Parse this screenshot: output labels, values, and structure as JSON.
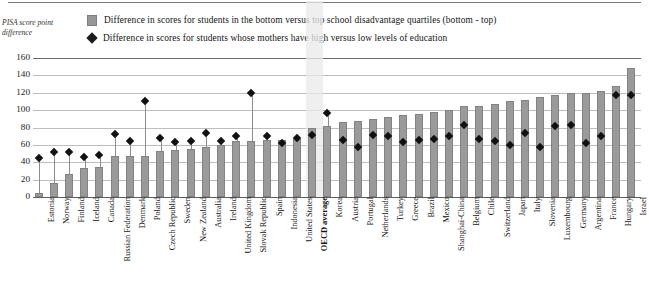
{
  "axis_title": "PISA score point difference",
  "legend": [
    {
      "marker": "bar-swatch",
      "label": "Difference in scores for students in the bottom versus top school disadvantage quartiles (bottom - top)"
    },
    {
      "marker": "diamond-marker",
      "label": "Difference in scores for students whose mothers have high versus low levels of education"
    }
  ],
  "highlight_category": "OECD average",
  "chart_data": {
    "type": "bar",
    "title": "",
    "xlabel": "",
    "ylabel": "PISA score point difference",
    "ylim": [
      0,
      160
    ],
    "yticks": [
      0,
      20,
      40,
      60,
      80,
      100,
      120,
      140,
      160
    ],
    "grid": true,
    "legend_position": "top",
    "categories": [
      "Estonia",
      "Norway",
      "Finland",
      "Iceland",
      "Canada",
      "Russian Federation",
      "Denmark",
      "Poland",
      "Czech Republic",
      "Sweden",
      "New Zealand",
      "Australia",
      "Ireland",
      "United Kingdom",
      "Slovak Republic",
      "Spain",
      "Indonesia",
      "United States",
      "OECD average",
      "Korea",
      "Austria",
      "Portugal",
      "Netherlands",
      "Turkey",
      "Greece",
      "Brazil",
      "Mexico",
      "Shanghai-China",
      "Belgium",
      "Chile",
      "Switzerland",
      "Japan",
      "Italy",
      "Slovenia",
      "Luxembourg",
      "Germany",
      "Argentina",
      "France",
      "Hungary",
      "Israel"
    ],
    "series": [
      {
        "name": "Difference in scores for students in the bottom versus top school disadvantage quartiles (bottom - top)",
        "type": "bar",
        "values": [
          5,
          16,
          26,
          33,
          35,
          47,
          47,
          47,
          53,
          54,
          55,
          58,
          60,
          65,
          65,
          66,
          66,
          67,
          79,
          82,
          86,
          88,
          90,
          92,
          94,
          96,
          98,
          100,
          105,
          105,
          107,
          110,
          112,
          115,
          118,
          120,
          120,
          122,
          128,
          148
        ]
      },
      {
        "name": "Difference in scores for students whose mothers have high versus low levels of education",
        "type": "scatter",
        "marker": "diamond",
        "values": [
          45,
          52,
          52,
          46,
          48,
          72,
          64,
          110,
          68,
          63,
          65,
          74,
          65,
          70,
          120,
          70,
          62,
          68,
          71,
          97,
          66,
          58,
          71,
          70,
          63,
          66,
          67,
          70,
          83,
          67,
          64,
          60,
          74,
          58,
          82,
          83,
          62,
          70,
          118,
          118
        ]
      }
    ]
  }
}
